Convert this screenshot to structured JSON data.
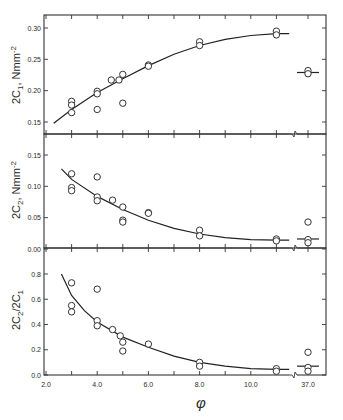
{
  "chart_data": [
    {
      "type": "scatter",
      "panel": "top",
      "ylabel": "2C1, Nmm^-2",
      "ylabel_main": "2C",
      "ylabel_sub": "1",
      "ylabel_unit": ", Nmm",
      "ylabel_sup": "-2",
      "ylim": [
        0.13,
        0.32
      ],
      "yticks": [
        "0.30",
        "0.25",
        "0.20",
        "0.15"
      ],
      "ytick_values": [
        0.3,
        0.25,
        0.2,
        0.15
      ],
      "points": [
        [
          3.0,
          0.183
        ],
        [
          3.0,
          0.177
        ],
        [
          3.0,
          0.165
        ],
        [
          4.0,
          0.199
        ],
        [
          4.0,
          0.195
        ],
        [
          4.0,
          0.17
        ],
        [
          4.55,
          0.217
        ],
        [
          4.85,
          0.217
        ],
        [
          5.0,
          0.226
        ],
        [
          5.0,
          0.18
        ],
        [
          6.0,
          0.241
        ],
        [
          6.0,
          0.239
        ],
        [
          8.0,
          0.278
        ],
        [
          8.0,
          0.272
        ],
        [
          11.0,
          0.295
        ],
        [
          11.0,
          0.289
        ],
        [
          37.0,
          0.232
        ],
        [
          37.0,
          0.227
        ]
      ],
      "fit_curve": [
        [
          2.3,
          0.148
        ],
        [
          3.0,
          0.17
        ],
        [
          4.0,
          0.197
        ],
        [
          5.0,
          0.219
        ],
        [
          6.0,
          0.24
        ],
        [
          7.0,
          0.258
        ],
        [
          8.0,
          0.272
        ],
        [
          9.0,
          0.282
        ],
        [
          10.0,
          0.288
        ],
        [
          11.0,
          0.291
        ],
        [
          11.5,
          0.291
        ]
      ],
      "fit_at_37": 0.229
    },
    {
      "type": "scatter",
      "panel": "middle",
      "ylabel": "2C2, Nmm^-2",
      "ylabel_main": "2C",
      "ylabel_sub": "2",
      "ylabel_unit": ", Nmm",
      "ylabel_sup": "-2",
      "ylim": [
        0.0,
        0.18
      ],
      "yticks": [
        "0.15",
        "0.10",
        "0.05",
        "0.00"
      ],
      "ytick_values": [
        0.15,
        0.1,
        0.05,
        0.0
      ],
      "points": [
        [
          3.0,
          0.12
        ],
        [
          3.0,
          0.098
        ],
        [
          3.0,
          0.093
        ],
        [
          4.0,
          0.115
        ],
        [
          4.0,
          0.083
        ],
        [
          4.0,
          0.077
        ],
        [
          4.6,
          0.078
        ],
        [
          5.0,
          0.067
        ],
        [
          5.0,
          0.046
        ],
        [
          5.0,
          0.043
        ],
        [
          6.0,
          0.058
        ],
        [
          6.0,
          0.057
        ],
        [
          8.0,
          0.03
        ],
        [
          8.0,
          0.021
        ],
        [
          11.0,
          0.016
        ],
        [
          11.0,
          0.013
        ],
        [
          37.0,
          0.043
        ],
        [
          37.0,
          0.015
        ],
        [
          37.0,
          0.01
        ]
      ],
      "fit_curve": [
        [
          2.6,
          0.128
        ],
        [
          3.0,
          0.111
        ],
        [
          4.0,
          0.084
        ],
        [
          5.0,
          0.063
        ],
        [
          6.0,
          0.046
        ],
        [
          7.0,
          0.033
        ],
        [
          8.0,
          0.024
        ],
        [
          9.0,
          0.018
        ],
        [
          10.0,
          0.015
        ],
        [
          11.0,
          0.014
        ],
        [
          11.5,
          0.014
        ]
      ],
      "fit_at_37": 0.016
    },
    {
      "type": "scatter",
      "panel": "bottom",
      "ylabel": "2C2/2C1",
      "ylabel_text": "2C2/2C1",
      "ylim": [
        0.0,
        0.9
      ],
      "yticks": [
        "0.8",
        "0.6",
        "0.4",
        "0.2",
        "0.0"
      ],
      "ytick_values": [
        0.8,
        0.6,
        0.4,
        0.2,
        0.0
      ],
      "points": [
        [
          3.0,
          0.73
        ],
        [
          3.0,
          0.55
        ],
        [
          3.0,
          0.5
        ],
        [
          4.0,
          0.68
        ],
        [
          4.0,
          0.43
        ],
        [
          4.0,
          0.39
        ],
        [
          4.6,
          0.36
        ],
        [
          4.9,
          0.31
        ],
        [
          5.0,
          0.26
        ],
        [
          5.0,
          0.19
        ],
        [
          6.0,
          0.245
        ],
        [
          8.0,
          0.1
        ],
        [
          8.0,
          0.07
        ],
        [
          11.0,
          0.05
        ],
        [
          11.0,
          0.03
        ],
        [
          37.0,
          0.18
        ],
        [
          37.0,
          0.06
        ],
        [
          37.0,
          0.03
        ]
      ],
      "fit_curve": [
        [
          2.6,
          0.8
        ],
        [
          3.0,
          0.63
        ],
        [
          3.5,
          0.51
        ],
        [
          4.0,
          0.42
        ],
        [
          5.0,
          0.3
        ],
        [
          6.0,
          0.22
        ],
        [
          7.0,
          0.15
        ],
        [
          8.0,
          0.1
        ],
        [
          9.0,
          0.07
        ],
        [
          10.0,
          0.05
        ],
        [
          11.0,
          0.045
        ],
        [
          11.5,
          0.045
        ]
      ],
      "fit_at_37": 0.07
    }
  ],
  "x_axis": {
    "label": "φ",
    "tick_labels": [
      "2.0",
      "4.0",
      "6.0",
      "8.0",
      "10.0",
      "37.0"
    ],
    "tick_values": [
      2.0,
      4.0,
      6.0,
      8.0,
      10.0,
      37.0
    ],
    "minor_ticks": [
      3.0,
      5.0,
      7.0,
      9.0,
      11.0
    ],
    "break_between": [
      11.5,
      37.0
    ]
  }
}
